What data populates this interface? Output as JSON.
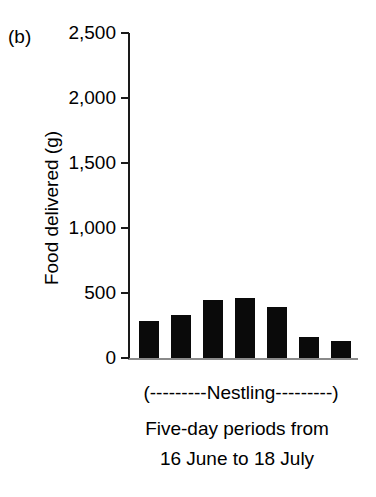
{
  "panel": {
    "label": "(b)"
  },
  "chart_data": {
    "type": "bar",
    "title": "",
    "subtitle": "",
    "panel_label": "(b)",
    "categories": [
      "1",
      "2",
      "3",
      "4",
      "5",
      "6",
      "7"
    ],
    "values": [
      285,
      330,
      445,
      460,
      390,
      160,
      130
    ],
    "series": [
      {
        "name": "Food delivered",
        "values": [
          285,
          330,
          445,
          460,
          390,
          160,
          130
        ]
      }
    ],
    "xlabel": "Five-day periods from 16 June to 18 July",
    "xlabel_lines": [
      "Five-day periods from",
      "16 June to 18 July"
    ],
    "bracket_annotation": "(---------Nestling---------)",
    "ylabel": "Food delivered (g)",
    "ylim": [
      0,
      2500
    ],
    "ytick_values": [
      0,
      500,
      1000,
      1500,
      2000,
      2500
    ],
    "ytick_labels": [
      "0",
      "500",
      "1,000",
      "1,500",
      "2,000",
      "2,500"
    ],
    "xtick_labels": [],
    "grid": false,
    "legend": null,
    "bar_color": "#0a0a0a",
    "axis_color": "#1a1a1a",
    "baseline_color": "#8a8a8a"
  },
  "axis": {
    "ylabel": "Food delivered (g)",
    "ytick_labels": [
      "2,500",
      "2,000",
      "1,500",
      "1,000",
      "500",
      "0"
    ]
  },
  "caption": {
    "nestling": "(---------Nestling---------)",
    "line1": "Five-day periods from",
    "line2": "16 June to 18 July"
  }
}
